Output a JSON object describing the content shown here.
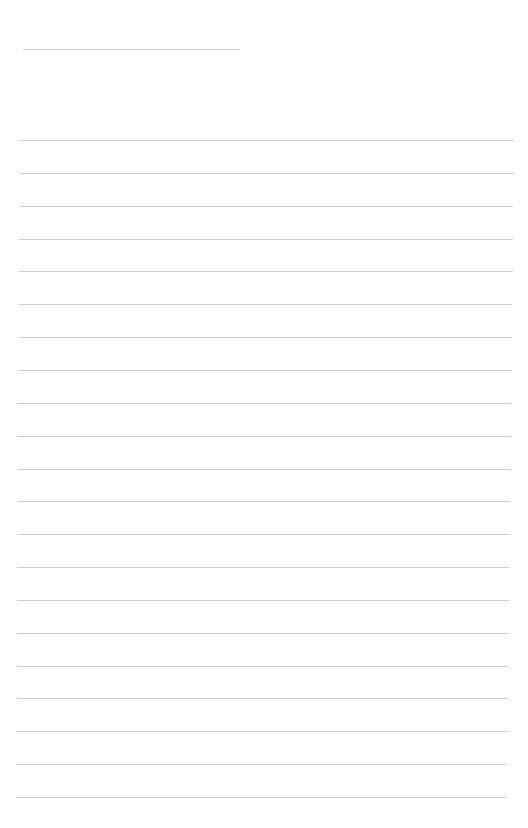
{
  "page": {
    "type": "lined-paper",
    "background": "#ffffff",
    "line_color": "#c9c9c9",
    "header_line": {
      "top": 49,
      "left": 23,
      "width": 217
    },
    "ruled_lines": {
      "count": 21,
      "first_top": 140,
      "spacing": 32.85,
      "left_start": 20,
      "left_end": 16,
      "right_start": 514,
      "right_end": 507
    }
  }
}
